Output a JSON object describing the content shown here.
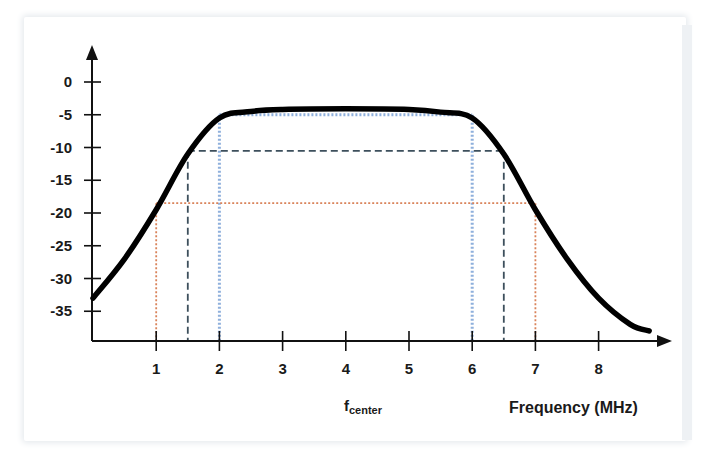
{
  "chart_data": {
    "type": "line",
    "title": "",
    "xlabel": "Frequency (MHz)",
    "ylabel": "",
    "annotation": {
      "main": "f",
      "subscript": "center",
      "x": 4
    },
    "x_ticks": [
      "1",
      "2",
      "3",
      "4",
      "5",
      "6",
      "7",
      "8"
    ],
    "y_ticks": [
      "0",
      "-5",
      "-10",
      "-15",
      "-20",
      "-25",
      "-30",
      "-35"
    ],
    "xlim": [
      0,
      9
    ],
    "ylim": [
      -39,
      5
    ],
    "grid": false,
    "series": [
      {
        "name": "Bandpass filter response",
        "color": "#000000",
        "x": [
          0,
          0.5,
          1.0,
          1.5,
          2.0,
          2.5,
          3,
          4,
          5,
          5.5,
          6.0,
          6.5,
          7.0,
          7.5,
          8.0,
          8.5,
          8.8
        ],
        "y": [
          -33,
          -27,
          -19.5,
          -11,
          -5.5,
          -4.5,
          -4.2,
          -4.1,
          -4.2,
          -4.6,
          -5.5,
          -11,
          -19.5,
          -27,
          -33,
          -37,
          -38
        ]
      }
    ],
    "reference_lines": [
      {
        "name": "-5 dB bandwidth",
        "level": -5,
        "x_from": 2,
        "x_to": 6,
        "style": "dotted",
        "color": "#8fb0dc"
      },
      {
        "name": "-10 dB bandwidth",
        "level": -10.5,
        "x_from": 1.5,
        "x_to": 6.5,
        "style": "dashed",
        "color": "#3d4f5c"
      },
      {
        "name": "-18 dB bandwidth",
        "level": -18.5,
        "x_from": 1,
        "x_to": 7,
        "style": "dotted",
        "color": "#d9835a"
      }
    ]
  },
  "labels": {
    "x_title": "Frequency (MHz)",
    "f_main": "f",
    "f_sub": "center"
  }
}
